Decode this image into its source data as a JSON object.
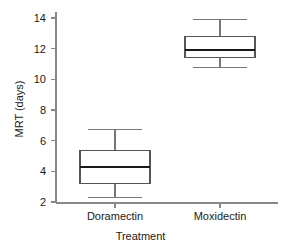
{
  "chart_data": {
    "type": "box",
    "title": "",
    "xlabel": "Treatment",
    "ylabel": "MRT (days)",
    "categories": [
      "Doramectin",
      "Moxidectin"
    ],
    "ylim": [
      1.6,
      14.6
    ],
    "yticks": [
      2,
      4,
      6,
      8,
      10,
      12,
      14
    ],
    "ytick_labels": [
      "2",
      "4",
      "6",
      "8",
      "10",
      "12",
      "14"
    ],
    "grid": false,
    "legend": "none",
    "series": [
      {
        "name": "Doramectin",
        "whisker_low": 2.3,
        "q1": 3.2,
        "median": 4.3,
        "q3": 5.35,
        "whisker_high": 6.75
      },
      {
        "name": "Moxidectin",
        "whisker_low": 10.8,
        "q1": 11.4,
        "median": 11.9,
        "q3": 12.8,
        "whisker_high": 13.9
      }
    ],
    "colors": {
      "box_stroke": "#555555",
      "median_stroke": "#1a1a1a",
      "whisker_stroke": "#777777",
      "axis_stroke": "#888888",
      "box_fill": "#ffffff",
      "text": "#1a1a1a"
    }
  }
}
